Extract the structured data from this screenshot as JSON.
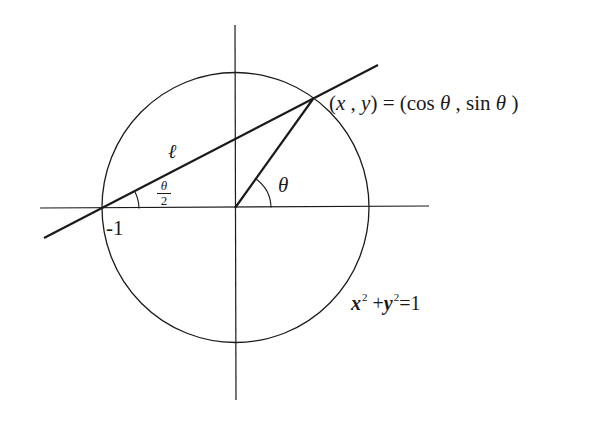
{
  "figure": {
    "type": "unit-circle-stereographic-construction",
    "colors": {
      "stroke": "#1a1a1a",
      "background": "#ffffff"
    }
  },
  "labels": {
    "point": {
      "open_paren": "(",
      "x": "x",
      "comma": " , ",
      "y": "y",
      "close_eq": ") = (cos ",
      "theta1": "θ",
      "mid": " , sin ",
      "theta2": "θ",
      "end": " )"
    },
    "equation": {
      "x": "x",
      "x_exp": "2",
      "plus": " +",
      "y": "y",
      "y_exp": "2",
      "rhs": "=1"
    },
    "neg_one": "-1",
    "line_name": "ℓ",
    "angle_theta": "θ",
    "half_angle": {
      "numerator": "θ",
      "denominator": "2"
    }
  },
  "geometry": {
    "circle": {
      "cx": 235.5,
      "cy": 207.5,
      "rx": 133.5,
      "ry": 135
    },
    "x_axis": {
      "x1": 40,
      "y1": 208,
      "x2": 429,
      "y2": 206
    },
    "y_axis": {
      "x1": 235,
      "y1": 25,
      "x2": 236,
      "y2": 400
    },
    "line_l": {
      "x1": 44,
      "y1": 238,
      "x2": 378,
      "y2": 65
    },
    "radius_segment": {
      "x1": 235,
      "y1": 208,
      "x2": 313,
      "y2": 99
    },
    "theta_arc": {
      "cx": 235,
      "cy": 208,
      "r": 36
    },
    "half_arc": {
      "cx": 102,
      "cy": 209,
      "r": 37
    }
  }
}
